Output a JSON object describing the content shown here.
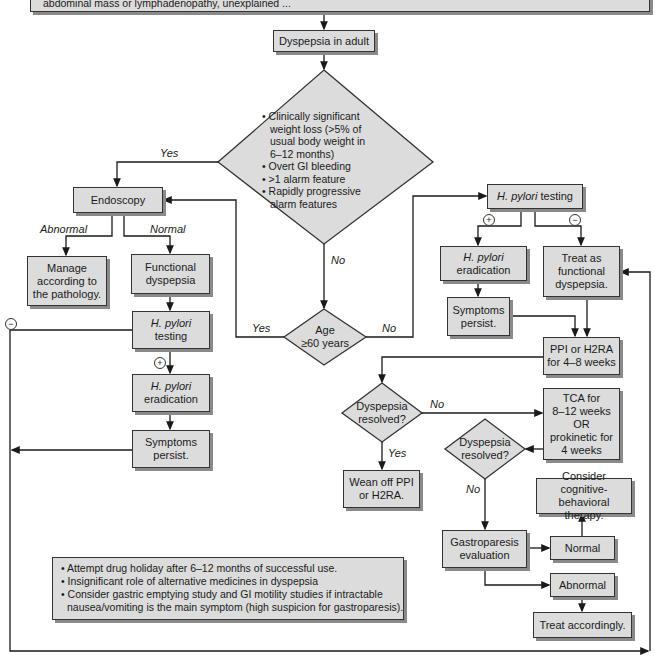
{
  "banner": {
    "text": "abdominal mass or lymphadenopathy, unexplained ..."
  },
  "nodes": {
    "start": "Dyspepsia in adult",
    "alarm_diamond": [
      "• Clinically significant",
      "  weight loss (>5% of",
      "  usual body weight in",
      "  6–12 months)",
      "• Overt GI bleeding",
      "• >1 alarm feature",
      "• Rapidly progressive",
      "  alarm features"
    ],
    "endoscopy": "Endoscopy",
    "manage_line1": "Manage",
    "manage_line2": "according to",
    "manage_line3": "the pathology.",
    "functional_line1": "Functional",
    "functional_line2": "dyspepsia",
    "hp_testing_left_italic": "H. pylori",
    "hp_testing_left_rest": "testing",
    "hp_erad_left_italic": "H. pylori",
    "hp_erad_left_rest": "eradication",
    "symptoms_left_line1": "Symptoms",
    "symptoms_left_line2": "persist.",
    "age_line1": "Age",
    "age_line2": "≥60 years",
    "hp_testing_right_italic": "H. pylori",
    "hp_testing_right_rest": " testing",
    "hp_erad_right_italic": "H. pylori",
    "hp_erad_right_rest": "eradication",
    "treat_functional_line1": "Treat as",
    "treat_functional_line2": "functional",
    "treat_functional_line3": "dyspepsia.",
    "symptoms_right_line1": "Symptoms",
    "symptoms_right_line2": "persist.",
    "ppi_line1": "PPI or H2RA",
    "ppi_line2": "for 4–8 weeks",
    "resolved1_line1": "Dyspepsia",
    "resolved1_line2": "resolved?",
    "tca_line1": "TCA for",
    "tca_line2": "8–12 weeks",
    "tca_line3": "OR",
    "tca_line4": "prokinetic for",
    "tca_line5": "4 weeks",
    "resolved2_line1": "Dyspepsia",
    "resolved2_line2": "resolved?",
    "wean_line1": "Wean off PPI",
    "wean_line2": "or H2RA.",
    "cbt_line1": "Consider cognitive-",
    "cbt_line2": "behavioral therapy.",
    "gastro_line1": "Gastroparesis",
    "gastro_line2": "evaluation",
    "normal": "Normal",
    "abnormal": "Abnormal",
    "treat_accordingly": "Treat accordingly."
  },
  "edge_labels": {
    "yes_alarm": "Yes",
    "no_alarm": "No",
    "abnormal": "Abnormal",
    "normal": "Normal",
    "yes_age": "Yes",
    "no_age": "No",
    "no_resolved1": "No",
    "yes_resolved1": "Yes",
    "no_resolved2": "No",
    "plus": "+",
    "minus": "−"
  },
  "note": {
    "items": [
      "• Attempt drug holiday after 6–12 months of successful use.",
      "• Insignificant role of alternative medicines in dyspepsia",
      "• Consider gastric emptying study and GI motility studies if intractable",
      "  nausea/vomiting is the main symptom (high suspicion for gastroparesis)."
    ]
  },
  "colors": {
    "box_fill": "#dcdcdc",
    "box_border": "#333333",
    "shadow": "#8a8a8a",
    "line": "#1a1a1a"
  }
}
